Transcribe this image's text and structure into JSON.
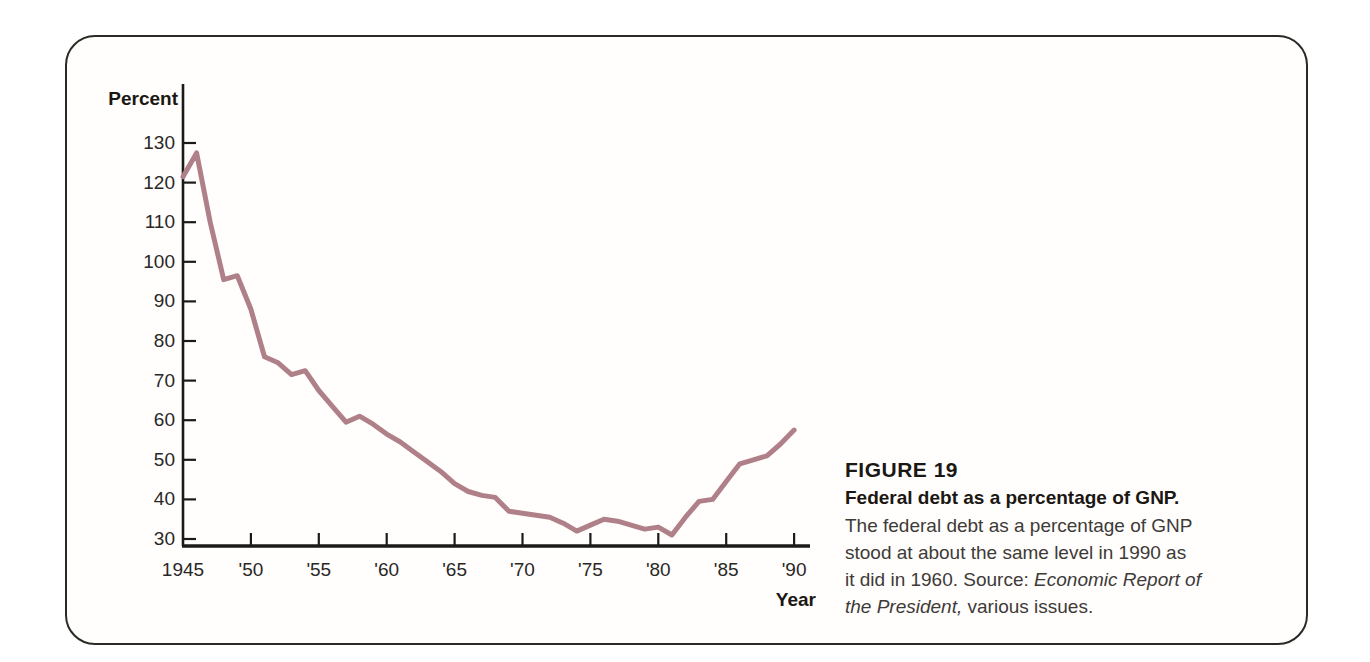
{
  "figure": {
    "caption": {
      "figure_label": "FIGURE 19",
      "title": "Federal debt as a percentage of GNP.",
      "body_lines": [
        [
          {
            "text": "The federal debt as a percentage of GNP",
            "style": "normal"
          }
        ],
        [
          {
            "text": "stood at about the same level in 1990 as",
            "style": "normal"
          }
        ],
        [
          {
            "text": "it did in 1960.  ",
            "style": "normal"
          },
          {
            "text": "Source: ",
            "style": "normal"
          },
          {
            "text": "Economic Report of",
            "style": "italic"
          }
        ],
        [
          {
            "text": "the President,",
            "style": "italic"
          },
          {
            "text": " various issues.",
            "style": "normal"
          }
        ]
      ]
    }
  },
  "chart_data": {
    "type": "line",
    "title": "Federal debt as a percentage of GNP",
    "xlabel": "Year",
    "ylabel": "Percent",
    "x": [
      1945,
      1946,
      1947,
      1948,
      1949,
      1950,
      1951,
      1952,
      1953,
      1954,
      1955,
      1956,
      1957,
      1958,
      1959,
      1960,
      1961,
      1962,
      1963,
      1964,
      1965,
      1966,
      1967,
      1968,
      1969,
      1970,
      1971,
      1972,
      1973,
      1974,
      1975,
      1976,
      1977,
      1978,
      1979,
      1980,
      1981,
      1982,
      1983,
      1984,
      1985,
      1986,
      1987,
      1988,
      1989,
      1990
    ],
    "values": [
      121.5,
      127.5,
      110,
      95.5,
      96.5,
      88,
      76,
      74.5,
      71.5,
      72.5,
      67.5,
      63.5,
      59.5,
      61,
      59,
      56.5,
      54.5,
      52,
      49.5,
      47,
      44,
      42,
      41,
      40.5,
      37,
      36.5,
      36,
      35.5,
      34,
      32,
      33.5,
      35,
      34.5,
      33.5,
      32.5,
      33,
      31,
      35.5,
      39.5,
      40,
      44.5,
      49,
      50,
      51,
      54,
      57.5
    ],
    "ylim": [
      30,
      130
    ],
    "xlim": [
      1945,
      1990
    ],
    "y_ticks": [
      30,
      40,
      50,
      60,
      70,
      80,
      90,
      100,
      110,
      120,
      130
    ],
    "x_tick_years": [
      1945,
      1950,
      1955,
      1960,
      1965,
      1970,
      1975,
      1980,
      1985,
      1990
    ],
    "x_tick_labels": [
      "1945",
      "'50",
      "'55",
      "'60",
      "'65",
      "'70",
      "'75",
      "'80",
      "'85",
      "'90"
    ],
    "grid": false,
    "legend": "none",
    "line_color": "#b08088",
    "axis_color": "#1c1a19",
    "tick_label_color": "#2a2726"
  }
}
